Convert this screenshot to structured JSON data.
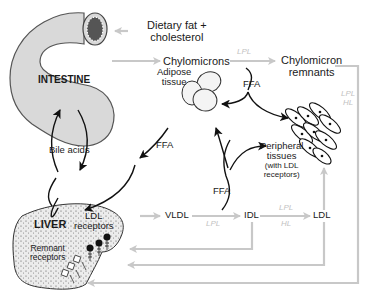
{
  "diagram": {
    "organs": {
      "intestine": "INTESTINE",
      "liver": "LIVER"
    },
    "labels": {
      "dietary": [
        "Dietary fat +",
        "cholesterol"
      ],
      "chylomicrons": "Chylomicrons",
      "chylomicron_remnants": [
        "Chylomicron",
        "remnants"
      ],
      "ffa_top": "FFA",
      "adipose": [
        "Adipose",
        "tissue"
      ],
      "ffa_left": "FFA",
      "bile_acids": "Bile acids",
      "peripheral": [
        "Peripheral",
        "tissues"
      ],
      "peripheral_note": [
        "(with LDL",
        "receptors)"
      ],
      "ffa_mid": "FFA",
      "vldl": "VLDL",
      "idl": "IDL",
      "ldl": "LDL",
      "ldl_receptors": [
        "LDL",
        "receptors"
      ],
      "remnant_receptors": [
        "Remnant",
        "receptors"
      ]
    },
    "enzymes": {
      "chylo_lpl": "LPL",
      "remnant_lpl": "LPL",
      "remnant_hl": "HL",
      "vldl_lpl": "LPL",
      "idl_lpl": "LPL",
      "idl_hl": "HL"
    },
    "colors": {
      "flow_arrow": "#c8c8c8",
      "black_arrow": "#111111",
      "organ_fill": "#d9d9d9",
      "enzyme_text": "#c2c2c2"
    }
  }
}
